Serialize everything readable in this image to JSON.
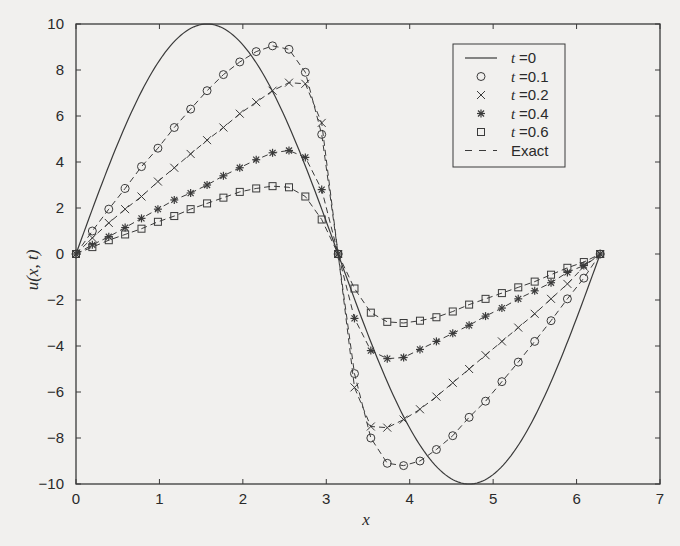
{
  "chart_data": {
    "type": "line",
    "title": "",
    "xlabel": "x",
    "ylabel": "u(x, t)",
    "xlim": [
      0,
      7
    ],
    "ylim": [
      -10,
      10
    ],
    "xticks": [
      0,
      1,
      2,
      3,
      4,
      5,
      6,
      7
    ],
    "yticks": [
      -10,
      -8,
      -6,
      -4,
      -2,
      0,
      2,
      4,
      6,
      8,
      10
    ],
    "grid": false,
    "legend_position": "upper right",
    "x": [
      0,
      0.196,
      0.393,
      0.589,
      0.785,
      0.982,
      1.178,
      1.374,
      1.571,
      1.767,
      1.963,
      2.16,
      2.356,
      2.553,
      2.749,
      2.945,
      3.142,
      3.338,
      3.534,
      3.731,
      3.927,
      4.123,
      4.32,
      4.516,
      4.712,
      4.909,
      5.105,
      5.301,
      5.498,
      5.694,
      5.89,
      6.087,
      6.283
    ],
    "series": [
      {
        "name": "t =0",
        "style": "solid-line",
        "marker": "none",
        "function": "10*sin(x)"
      },
      {
        "name": "t =0.1",
        "style": "dashed",
        "marker": "circle",
        "values": [
          0,
          1.0,
          1.95,
          2.85,
          3.8,
          4.6,
          5.5,
          6.3,
          7.1,
          7.8,
          8.35,
          8.8,
          9.05,
          8.9,
          7.9,
          5.2,
          0,
          -5.2,
          -8.0,
          -9.1,
          -9.2,
          -9.0,
          -8.5,
          -7.9,
          -7.1,
          -6.4,
          -5.55,
          -4.7,
          -3.8,
          -2.9,
          -1.95,
          -1.05,
          0
        ]
      },
      {
        "name": "t =0.2",
        "style": "dashed",
        "marker": "x",
        "values": [
          0,
          0.7,
          1.35,
          1.95,
          2.5,
          3.15,
          3.75,
          4.35,
          4.95,
          5.5,
          6.1,
          6.6,
          7.1,
          7.45,
          7.4,
          5.7,
          0,
          -5.8,
          -7.5,
          -7.55,
          -7.2,
          -6.75,
          -6.2,
          -5.6,
          -5.0,
          -4.4,
          -3.8,
          -3.2,
          -2.6,
          -1.95,
          -1.3,
          -0.55,
          0
        ]
      },
      {
        "name": "t =0.4",
        "style": "dashed",
        "marker": "asterisk",
        "values": [
          0,
          0.4,
          0.75,
          1.15,
          1.55,
          1.95,
          2.35,
          2.65,
          3.0,
          3.4,
          3.75,
          4.1,
          4.4,
          4.5,
          4.2,
          2.8,
          0,
          -2.8,
          -4.2,
          -4.55,
          -4.5,
          -4.15,
          -3.8,
          -3.45,
          -3.1,
          -2.7,
          -2.35,
          -1.95,
          -1.6,
          -1.25,
          -0.8,
          -0.5,
          0
        ]
      },
      {
        "name": "t =0.6",
        "style": "dashed",
        "marker": "square",
        "values": [
          0,
          0.3,
          0.6,
          0.85,
          1.1,
          1.4,
          1.65,
          1.95,
          2.2,
          2.45,
          2.7,
          2.85,
          2.95,
          2.9,
          2.5,
          1.5,
          0,
          -1.5,
          -2.55,
          -2.95,
          -3.0,
          -2.9,
          -2.75,
          -2.5,
          -2.2,
          -1.95,
          -1.7,
          -1.45,
          -1.2,
          -0.9,
          -0.6,
          -0.35,
          0
        ]
      }
    ],
    "legend": [
      {
        "prefix": "t",
        "label": "=0",
        "symbol": "solid-line"
      },
      {
        "prefix": "t",
        "label": "=0.1",
        "symbol": "circle"
      },
      {
        "prefix": "t",
        "label": "=0.2",
        "symbol": "x"
      },
      {
        "prefix": "t",
        "label": "=0.4",
        "symbol": "asterisk"
      },
      {
        "prefix": "t",
        "label": "=0.6",
        "symbol": "square"
      },
      {
        "prefix": "",
        "label": "Exact",
        "symbol": "dashed-line"
      }
    ],
    "colors": {
      "ink": "#3a3a3a",
      "background": "#f1f0ee"
    }
  }
}
